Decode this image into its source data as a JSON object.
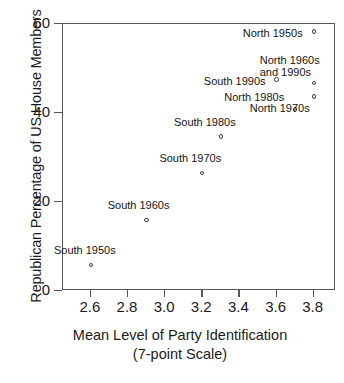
{
  "chart_data": {
    "type": "scatter",
    "title": "",
    "xlabel": "Mean Level of Party Identification",
    "xlabel_line2": "(7-point Scale)",
    "ylabel": "Republican Percentage of US House Members",
    "xlim": [
      2.45,
      3.92
    ],
    "ylim": [
      0,
      60
    ],
    "grid": false,
    "legend": "none",
    "xticks": [
      "2.6",
      "2.8",
      "3.0",
      "3.2",
      "3.4",
      "3.6",
      "3.8"
    ],
    "xtick_values": [
      2.6,
      2.8,
      3.0,
      3.2,
      3.4,
      3.6,
      3.8
    ],
    "yticks": [
      "60",
      "40",
      "20",
      "0"
    ],
    "ytick_values": [
      60,
      40,
      20,
      0
    ],
    "marker": "open-circle",
    "marker_color": "#3d3d3d",
    "points": [
      {
        "label": "South 1950s",
        "x": 2.6,
        "y": 5.8,
        "label_dx": -6,
        "label_dy": -20,
        "align": "left"
      },
      {
        "label": "South 1960s",
        "x": 2.9,
        "y": 16.0,
        "label_dx": -8,
        "label_dy": -20,
        "align": "left"
      },
      {
        "label": "South 1970s",
        "x": 3.2,
        "y": 26.5,
        "label_dx": -12,
        "label_dy": -20,
        "align": "left"
      },
      {
        "label": "South 1980s",
        "x": 3.3,
        "y": 34.7,
        "label_dx": -16,
        "label_dy": -20,
        "align": "left"
      },
      {
        "label": "South 1990s",
        "x": 3.6,
        "y": 47.5,
        "label_dx": -9,
        "label_dy": -4,
        "align": "right"
      },
      {
        "label": "North 1950s",
        "x": 3.8,
        "y": 58.3,
        "label_dx": -9,
        "label_dy": -4,
        "align": "right"
      },
      {
        "label": "North 1960s\nand 1990s",
        "x": 3.8,
        "y": 46.7,
        "label_dx": 8,
        "label_dy": -28,
        "align": "left"
      },
      {
        "label": "North 1980s",
        "x": 3.7,
        "y": 40.8,
        "label_dx": -9,
        "label_dy": -17,
        "align": "right"
      },
      {
        "label": "North 1970s",
        "x": 3.8,
        "y": 43.7,
        "label_dx": -34,
        "label_dy": 6,
        "align": "left"
      }
    ]
  },
  "caption": {
    "text": ""
  }
}
